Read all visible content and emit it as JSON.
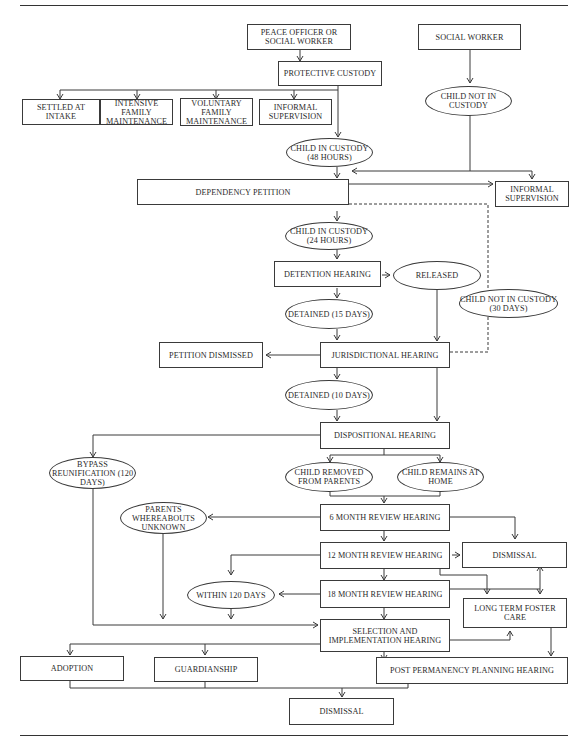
{
  "diagram": {
    "nodes": {
      "peace_officer": "PEACE OFFICER OR SOCIAL WORKER",
      "social_worker": "SOCIAL WORKER",
      "protective_custody": "PROTECTIVE CUSTODY",
      "settled_at_intake": "SETTLED AT INTAKE",
      "intensive_family": "INTENSIVE FAMILY MAINTENANCE",
      "voluntary_family": "VOLUNTARY FAMILY MAINTENANCE",
      "informal_supervision_1": "INFORMAL SUPERVISION",
      "child_not_in_custody": "CHILD NOT IN CUSTODY",
      "child_in_custody_48": "CHILD IN CUSTODY (48 HOURS)",
      "dependency_petition": "DEPENDENCY PETITION",
      "informal_supervision_2": "INFORMAL SUPERVISION",
      "child_in_custody_24": "CHILD IN CUSTODY (24 HOURS)",
      "detention_hearing": "DETENTION HEARING",
      "released": "RELEASED",
      "child_not_in_custody_30": "CHILD NOT IN CUSTODY (30 DAYS)",
      "detained_15": "DETAINED (15 DAYS)",
      "petition_dismissed": "PETITION DISMISSED",
      "jurisdictional_hearing": "JURISDICTIONAL HEARING",
      "detained_10": "DETAINED (10 DAYS)",
      "dispositional_hearing": "DISPOSITIONAL HEARING",
      "bypass_reunification": "BYPASS REUNIFICATION (120 DAYS)",
      "child_removed": "CHILD REMOVED FROM PARENTS",
      "child_remains": "CHILD REMAINS AT HOME",
      "parents_whereabouts": "PARENTS WHEREABOUTS UNKNOWN",
      "review_6": "6 MONTH REVIEW HEARING",
      "review_12": "12 MONTH REVIEW HEARING",
      "dismissal_1": "DISMISSAL",
      "within_120": "WITHIN 120 DAYS",
      "review_18": "18 MONTH REVIEW HEARING",
      "long_term_foster": "LONG TERM FOSTER CARE",
      "selection_hearing": "SELECTION AND IMPLEMENTATION HEARING",
      "adoption": "ADOPTION",
      "guardianship": "GUARDIANSHIP",
      "post_permanency": "POST PERMANENCY PLANNING HEARING",
      "dismissal_2": "DISMISSAL"
    },
    "colors": {
      "line": "#3a3a3a",
      "text": "#2a2a2a",
      "background": "#ffffff"
    }
  }
}
